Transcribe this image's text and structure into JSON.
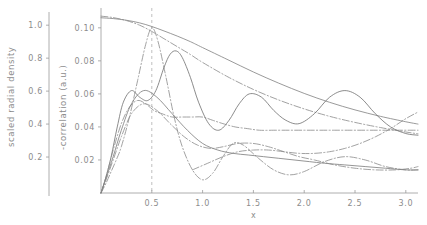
{
  "chart_data": {
    "type": "line",
    "title": "",
    "xlabel": "x",
    "ylabel_left_outer": "scaled radial density",
    "ylabel_left_inner": "-correlation (a.u.)",
    "xlim": [
      0,
      3.12
    ],
    "xticks": [
      0.5,
      1.0,
      1.5,
      2.0,
      2.5,
      3.0
    ],
    "xticklabels": [
      "0.5",
      "1.0",
      "1.5",
      "2.0",
      "2.5",
      "3.0"
    ],
    "axis_left_outer": {
      "label": "scaled radial density",
      "ylim": [
        0.0,
        1.08
      ],
      "yticks": [
        0.2,
        0.4,
        0.6,
        0.8,
        1.0
      ],
      "yticklabels": [
        "0.2",
        "0.4",
        "0.6",
        "0.8",
        "1.0"
      ]
    },
    "axis_left_inner": {
      "label": "-correlation (a.u.)",
      "ylim": [
        0.0,
        0.112
      ],
      "yticks": [
        0.02,
        0.04,
        0.06,
        0.08,
        0.1
      ],
      "yticklabels": [
        "0.02",
        "0.04",
        "0.06",
        "0.08",
        "0.10"
      ]
    },
    "grid": false,
    "legend": "none",
    "annotations": [
      {
        "name": "vertical-reference-line",
        "type": "vline",
        "x": 0.5,
        "style": "dashed"
      }
    ],
    "series": [
      {
        "name": "radial-density-solid",
        "style": "solid",
        "color": "#808080",
        "axis": "left_outer",
        "x": [
          0.0,
          0.12,
          0.25,
          0.38,
          0.5,
          0.62,
          0.75,
          0.88,
          1.0,
          1.25,
          1.5,
          1.75,
          2.0,
          2.25,
          2.5,
          2.75,
          3.0,
          3.12
        ],
        "y": [
          1.045,
          1.04,
          1.03,
          1.014,
          0.992,
          0.965,
          0.934,
          0.9,
          0.864,
          0.79,
          0.716,
          0.648,
          0.586,
          0.532,
          0.486,
          0.447,
          0.414,
          0.4
        ]
      },
      {
        "name": "radial-density-dashdot",
        "style": "dashdot",
        "color": "#8a8a8a",
        "axis": "left_outer",
        "x": [
          0.0,
          0.12,
          0.25,
          0.38,
          0.5,
          0.62,
          0.75,
          0.88,
          1.0,
          1.25,
          1.5,
          1.75,
          2.0,
          2.25,
          2.5,
          2.75,
          3.0,
          3.12
        ],
        "y": [
          1.055,
          1.046,
          1.028,
          1.0,
          0.962,
          0.918,
          0.87,
          0.822,
          0.774,
          0.686,
          0.61,
          0.546,
          0.492,
          0.447,
          0.41,
          0.379,
          0.352,
          0.341
        ]
      },
      {
        "name": "correlation-peak-dashdot-narrow",
        "style": "dashdot",
        "color": "#8a8a8a",
        "axis": "left_inner",
        "x": [
          0.0,
          0.05,
          0.1,
          0.15,
          0.2,
          0.28,
          0.36,
          0.44,
          0.5,
          0.56,
          0.64,
          0.72,
          0.8,
          0.9,
          1.0,
          1.1,
          1.2,
          1.3,
          1.4,
          1.55,
          1.7,
          1.85,
          2.0,
          2.2,
          2.4,
          2.6,
          2.8,
          3.0,
          3.12
        ],
        "y": [
          0.0,
          0.006,
          0.013,
          0.02,
          0.028,
          0.046,
          0.068,
          0.09,
          0.1,
          0.092,
          0.07,
          0.046,
          0.028,
          0.014,
          0.008,
          0.012,
          0.022,
          0.03,
          0.029,
          0.021,
          0.014,
          0.011,
          0.013,
          0.019,
          0.022,
          0.02,
          0.016,
          0.014,
          0.014
        ]
      },
      {
        "name": "correlation-peak-solid-shifted",
        "style": "solid",
        "color": "#6e6e6e",
        "axis": "left_inner",
        "x": [
          0.0,
          0.05,
          0.1,
          0.16,
          0.22,
          0.3,
          0.38,
          0.46,
          0.54,
          0.62,
          0.68,
          0.74,
          0.8,
          0.88,
          0.96,
          1.06,
          1.16,
          1.26,
          1.36,
          1.46,
          1.58,
          1.7,
          1.82,
          1.95,
          2.1,
          2.25,
          2.4,
          2.55,
          2.7,
          2.85,
          3.0,
          3.12
        ],
        "y": [
          0.0,
          0.01,
          0.022,
          0.04,
          0.055,
          0.062,
          0.058,
          0.056,
          0.062,
          0.076,
          0.084,
          0.086,
          0.082,
          0.07,
          0.055,
          0.042,
          0.038,
          0.044,
          0.054,
          0.06,
          0.058,
          0.05,
          0.044,
          0.042,
          0.048,
          0.058,
          0.062,
          0.058,
          0.048,
          0.04,
          0.036,
          0.035
        ]
      },
      {
        "name": "correlation-oscillating-dashdot",
        "style": "dashdot",
        "color": "#8a8a8a",
        "axis": "left_inner",
        "x": [
          0.0,
          0.06,
          0.12,
          0.2,
          0.28,
          0.36,
          0.44,
          0.52,
          0.6,
          0.7,
          0.8,
          0.9,
          1.0,
          1.1,
          1.2,
          1.32,
          1.44,
          1.56,
          1.7,
          1.85,
          2.0,
          2.15,
          2.3,
          2.45,
          2.6,
          2.75,
          2.9,
          3.05,
          3.12
        ],
        "y": [
          0.0,
          0.012,
          0.026,
          0.042,
          0.052,
          0.056,
          0.054,
          0.05,
          0.048,
          0.046,
          0.046,
          0.046,
          0.046,
          0.044,
          0.042,
          0.04,
          0.039,
          0.038,
          0.038,
          0.038,
          0.038,
          0.038,
          0.038,
          0.038,
          0.038,
          0.038,
          0.038,
          0.038,
          0.038
        ]
      },
      {
        "name": "correlation-lower-solid",
        "style": "solid",
        "color": "#7a7a7a",
        "axis": "left_inner",
        "x": [
          0.0,
          0.05,
          0.12,
          0.2,
          0.3,
          0.42,
          0.55,
          0.7,
          0.85,
          1.0,
          1.15,
          1.3,
          1.45,
          1.6,
          1.75,
          1.9,
          2.05,
          2.2,
          2.4,
          2.6,
          2.8,
          3.0,
          3.12
        ],
        "y": [
          0.0,
          0.009,
          0.022,
          0.038,
          0.054,
          0.062,
          0.058,
          0.048,
          0.038,
          0.03,
          0.026,
          0.024,
          0.023,
          0.022,
          0.021,
          0.02,
          0.019,
          0.018,
          0.017,
          0.016,
          0.015,
          0.014,
          0.014
        ]
      },
      {
        "name": "correlation-lower-dashdot",
        "style": "dashdot",
        "color": "#8a8a8a",
        "axis": "left_inner",
        "x": [
          0.0,
          0.05,
          0.12,
          0.2,
          0.3,
          0.42,
          0.55,
          0.68,
          0.82,
          0.95,
          1.08,
          1.2,
          1.35,
          1.5,
          1.65,
          1.8,
          1.95,
          2.1,
          2.3,
          2.5,
          2.7,
          2.9,
          3.05,
          3.12
        ],
        "y": [
          0.0,
          0.008,
          0.02,
          0.034,
          0.048,
          0.054,
          0.05,
          0.042,
          0.034,
          0.029,
          0.027,
          0.028,
          0.03,
          0.03,
          0.028,
          0.025,
          0.022,
          0.02,
          0.017,
          0.015,
          0.014,
          0.014,
          0.015,
          0.016
        ]
      },
      {
        "name": "correlation-rising-tail-dashdot",
        "style": "dashdot",
        "color": "#8a8a8a",
        "axis": "left_inner",
        "x": [
          0.9,
          1.05,
          1.2,
          1.35,
          1.5,
          1.65,
          1.8,
          1.95,
          2.1,
          2.25,
          2.4,
          2.55,
          2.7,
          2.85,
          3.0,
          3.12
        ],
        "y": [
          0.014,
          0.018,
          0.022,
          0.025,
          0.026,
          0.026,
          0.025,
          0.024,
          0.024,
          0.025,
          0.027,
          0.03,
          0.034,
          0.039,
          0.045,
          0.049
        ]
      }
    ]
  },
  "figure": {
    "background": "#ffffff",
    "line_color": "#8a8a8a",
    "axis_color": "#9a9a9a"
  }
}
